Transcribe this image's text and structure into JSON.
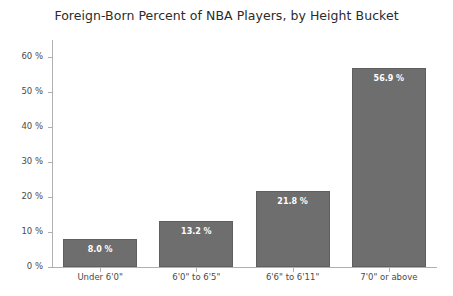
{
  "chart_data": {
    "type": "bar",
    "title": "Foreign-Born Percent of NBA Players, by Height Bucket",
    "xlabel": "",
    "ylabel": "",
    "categories": [
      "Under 6'0\"",
      "6'0\" to 6'5\"",
      "6'6\" to 6'11\"",
      "7'0\" or above"
    ],
    "values": [
      8.0,
      13.2,
      21.8,
      56.9
    ],
    "value_labels": [
      "8.0 %",
      "13.2 %",
      "21.8 %",
      "56.9 %"
    ],
    "ylim": [
      0,
      65
    ],
    "ytick_values": [
      0,
      10,
      20,
      30,
      40,
      50,
      60
    ],
    "ytick_labels": [
      "0 %",
      "10 %",
      "20 %",
      "30 %",
      "40 %",
      "50 %",
      "60 %"
    ],
    "grid": false,
    "legend": null,
    "bar_color": "#6e6e6e",
    "bar_edge_color": "#5f5f5f",
    "label_color": "#ffffff",
    "background_color": "#ffffff",
    "axis_color": "#b0b0b0",
    "tick_text_color": "#4a4a4a",
    "title_color": "#2b2b2b"
  }
}
